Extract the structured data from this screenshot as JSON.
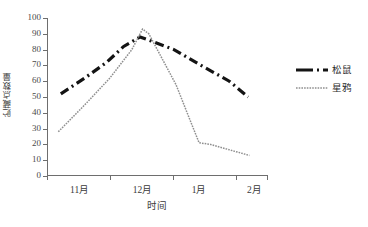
{
  "chart_data": {
    "type": "line",
    "title": "",
    "xlabel": "时间",
    "ylabel": "贮藏点数量",
    "categories": [
      "11月",
      "12月",
      "1月",
      "2月"
    ],
    "yticks": [
      0,
      10,
      20,
      30,
      40,
      50,
      60,
      70,
      80,
      90,
      100
    ],
    "ylim": [
      0,
      100
    ],
    "xlim": [
      0,
      3.5
    ],
    "grid": false,
    "legend_position": "right",
    "series": [
      {
        "name": "松鼠",
        "style": "thick-dashed",
        "color": "#141414",
        "points": [
          {
            "x": 0.22,
            "y": 52
          },
          {
            "x": 0.6,
            "y": 62
          },
          {
            "x": 0.95,
            "y": 72
          },
          {
            "x": 1.22,
            "y": 82
          },
          {
            "x": 1.48,
            "y": 88
          },
          {
            "x": 1.62,
            "y": 86
          },
          {
            "x": 2.02,
            "y": 80
          },
          {
            "x": 2.45,
            "y": 70
          },
          {
            "x": 2.9,
            "y": 60
          },
          {
            "x": 3.2,
            "y": 50
          }
        ]
      },
      {
        "name": "星鸦",
        "style": "thin-dotted",
        "color": "#8f8f8f",
        "points": [
          {
            "x": 0.18,
            "y": 28
          },
          {
            "x": 0.6,
            "y": 45
          },
          {
            "x": 1.0,
            "y": 62
          },
          {
            "x": 1.35,
            "y": 80
          },
          {
            "x": 1.52,
            "y": 93
          },
          {
            "x": 1.62,
            "y": 90
          },
          {
            "x": 2.05,
            "y": 58
          },
          {
            "x": 2.42,
            "y": 21
          },
          {
            "x": 2.6,
            "y": 20
          },
          {
            "x": 3.22,
            "y": 13
          }
        ]
      }
    ]
  },
  "legend": {
    "items": [
      {
        "label": "松鼠",
        "icon": "thick-dashed-line-icon"
      },
      {
        "label": "星鸦",
        "icon": "thin-dotted-line-icon"
      }
    ]
  }
}
